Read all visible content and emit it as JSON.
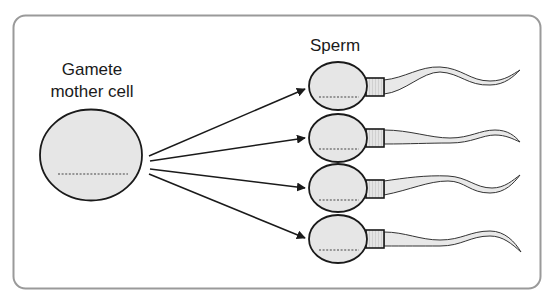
{
  "diagram": {
    "mother_cell": {
      "label_line1": "Gamete",
      "label_line2": "mother cell",
      "fill": "#e6e6e6",
      "stroke": "#1a1a1a"
    },
    "sperm": {
      "label": "Sperm",
      "count": 4,
      "head_fill": "#e6e6e6",
      "tail_fill": "#e8e8e8"
    },
    "frame": {
      "stroke": "#9a9a9a"
    },
    "arrows": [
      {
        "from": "mother-cell",
        "to": "sperm-1"
      },
      {
        "from": "mother-cell",
        "to": "sperm-2"
      },
      {
        "from": "mother-cell",
        "to": "sperm-3"
      },
      {
        "from": "mother-cell",
        "to": "sperm-4"
      }
    ]
  }
}
